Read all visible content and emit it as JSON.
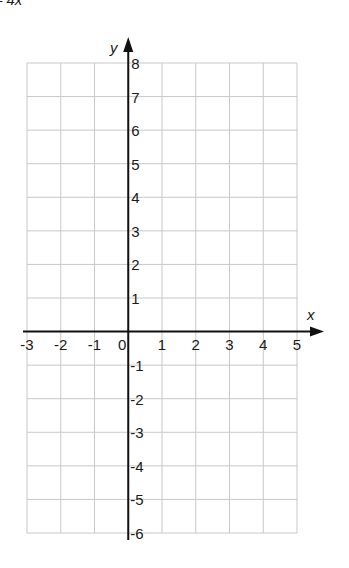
{
  "header": {
    "title_fragment": "– 4x"
  },
  "axes": {
    "x_label": "x",
    "y_label": "y",
    "x_min": -3,
    "x_max": 5,
    "y_min": -6,
    "y_max": 8,
    "x_ticks": [
      "-3",
      "-2",
      "-1",
      "0",
      "1",
      "2",
      "3",
      "4",
      "5"
    ],
    "y_ticks_pos": [
      "1",
      "2",
      "3",
      "4",
      "5",
      "6",
      "7",
      "8"
    ],
    "y_ticks_neg": [
      "-1",
      "-2",
      "-3",
      "-4",
      "-5",
      "-6"
    ]
  },
  "colors": {
    "grid": "#c8c8c8",
    "axis": "#111111",
    "text": "#1a1a1a"
  },
  "chart_data": {
    "type": "scatter",
    "title": "– 4x",
    "xlabel": "x",
    "ylabel": "y",
    "xlim": [
      -3,
      5
    ],
    "ylim": [
      -6,
      8
    ],
    "grid": true,
    "series": [],
    "x_tick_labels": [
      "-3",
      "-2",
      "-1",
      "0",
      "1",
      "2",
      "3",
      "4",
      "5"
    ],
    "y_tick_labels": [
      "-6",
      "-5",
      "-4",
      "-3",
      "-2",
      "-1",
      "1",
      "2",
      "3",
      "4",
      "5",
      "6",
      "7",
      "8"
    ]
  }
}
